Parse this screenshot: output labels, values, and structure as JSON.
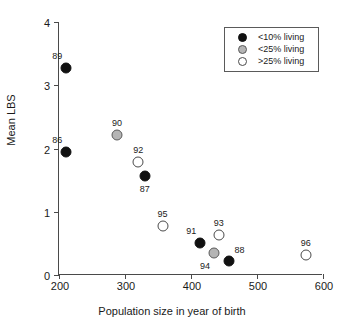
{
  "chart_data": {
    "type": "scatter",
    "title": "",
    "xlabel": "Population size in year of birth",
    "ylabel": "Mean LBS",
    "xlim": [
      200,
      600
    ],
    "ylim": [
      0,
      4
    ],
    "xticks": [
      "200",
      "300",
      "400",
      "500",
      "600"
    ],
    "yticks": [
      "0",
      "1",
      "2",
      "3",
      "4"
    ],
    "grid": false,
    "legend_position": "top-right",
    "legend": [
      {
        "label": "<10% living",
        "marker": "filled"
      },
      {
        "label": "<25% living",
        "marker": "grey"
      },
      {
        "label": ">25% living",
        "marker": "open"
      }
    ],
    "points": [
      {
        "label": "89",
        "x": 211,
        "y": 3.28,
        "marker": "filled",
        "label_pos": "above-left"
      },
      {
        "label": "86",
        "x": 211,
        "y": 1.95,
        "marker": "filled",
        "label_pos": "above-left"
      },
      {
        "label": "90",
        "x": 288,
        "y": 2.22,
        "marker": "grey",
        "label_pos": "above"
      },
      {
        "label": "92",
        "x": 320,
        "y": 1.78,
        "marker": "open",
        "label_pos": "above"
      },
      {
        "label": "87",
        "x": 330,
        "y": 1.56,
        "marker": "filled",
        "label_pos": "below"
      },
      {
        "label": "95",
        "x": 357,
        "y": 0.78,
        "marker": "open",
        "label_pos": "above"
      },
      {
        "label": "91",
        "x": 414,
        "y": 0.5,
        "marker": "filled",
        "label_pos": "above-left"
      },
      {
        "label": "93",
        "x": 442,
        "y": 0.63,
        "marker": "open",
        "label_pos": "above"
      },
      {
        "label": "94",
        "x": 435,
        "y": 0.35,
        "marker": "grey",
        "label_pos": "below-left"
      },
      {
        "label": "88",
        "x": 457,
        "y": 0.22,
        "marker": "filled",
        "label_pos": "above-right"
      },
      {
        "label": "96",
        "x": 574,
        "y": 0.32,
        "marker": "open",
        "label_pos": "above"
      }
    ]
  },
  "colors": {
    "axis": "#4a4a4a",
    "text": "#1a1a1a",
    "filled_marker": "#111111",
    "grey_marker": "#b5b5b5",
    "open_marker": "#ffffff",
    "background": "#ffffff"
  }
}
